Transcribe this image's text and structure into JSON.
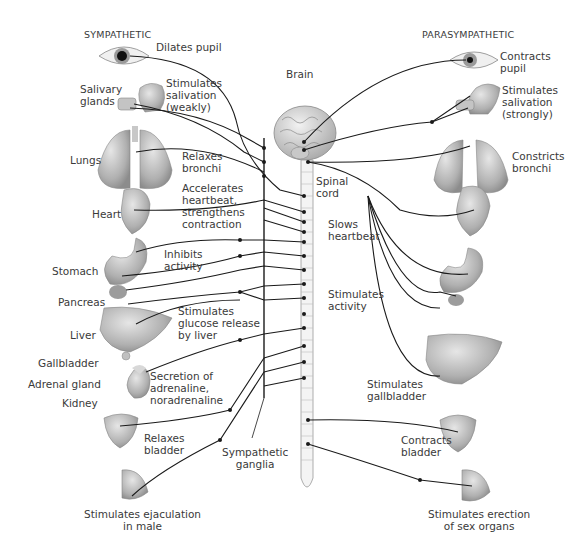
{
  "headers": {
    "sympathetic": "SYMPATHETIC",
    "parasympathetic": "PARASYMPATHETIC"
  },
  "central": {
    "brain": "Brain",
    "spinal_cord": "Spinal\ncord",
    "sympathetic_ganglia": "Sympathetic\nganglia"
  },
  "sympathetic": {
    "organs": {
      "salivary_glands": "Salivary\nglands",
      "lungs": "Lungs",
      "heart": "Heart",
      "stomach": "Stomach",
      "pancreas": "Pancreas",
      "liver": "Liver",
      "gallbladder": "Gallbladder",
      "adrenal_gland": "Adrenal gland",
      "kidney": "Kidney"
    },
    "effects": {
      "eye": "Dilates pupil",
      "salivary": "Stimulates\nsalivation\n(weakly)",
      "lungs": "Relaxes\nbronchi",
      "heart": "Accelerates\nheartbeat,\nstrengthens\ncontraction",
      "stomach": "Inhibits\nactivity",
      "liver": "Stimulates\nglucose release\nby liver",
      "adrenal": "Secretion of\nadrenaline,\nnoradrenaline",
      "bladder": "Relaxes\nbladder",
      "genitals": "Stimulates ejaculation\nin male"
    }
  },
  "parasympathetic": {
    "effects": {
      "eye": "Contracts\npupil",
      "salivary": "Stimulates\nsalivation\n(strongly)",
      "lungs": "Constricts\nbronchi",
      "heart": "Slows\nheartbeat",
      "digestive": "Stimulates\nactivity",
      "gallbladder": "Stimulates\ngallbladder",
      "bladder": "Contracts\nbladder",
      "genitals": "Stimulates erection\nof sex organs"
    }
  },
  "colors": {
    "nerve": "#1a1a1a",
    "organ_fill": "#b4b4b4",
    "organ_dark": "#8a8a8a",
    "cord_fill": "#f4f4f4",
    "text": "#3a3a3a"
  }
}
